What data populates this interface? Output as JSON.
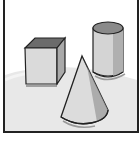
{
  "figure": {
    "caption_cropped": "",
    "shapes": [
      {
        "name": "cube",
        "label": "Cube"
      },
      {
        "name": "cylinder",
        "label": "Cylinder"
      },
      {
        "name": "cone",
        "label": "Cone"
      }
    ],
    "colors": {
      "border": "#222222",
      "floor": "#e6e6e6",
      "background": "#ffffff",
      "cube_top": "#6b6b6b",
      "cube_front": "#d9d9d9",
      "cube_side": "#a8a8a8",
      "cylinder_top": "#8a8a8a",
      "cylinder_body": "#d4d4d4",
      "cone_body": "#dcdcdc",
      "cone_shadow": "#9c9c9c"
    }
  }
}
